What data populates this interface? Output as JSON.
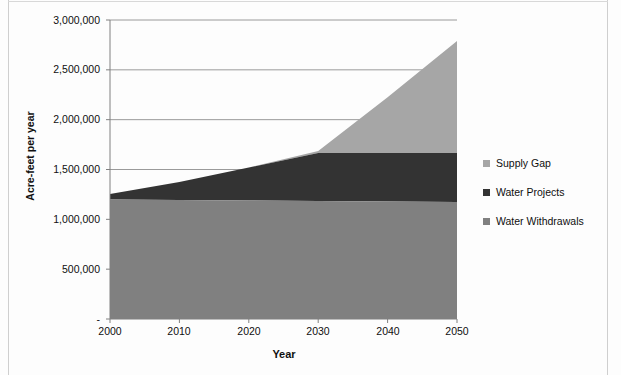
{
  "chart_data": {
    "type": "area",
    "title": "",
    "subtitle": "",
    "xlabel": "Year",
    "ylabel": "Acre-feet per year",
    "x": [
      2000,
      2010,
      2020,
      2030,
      2040,
      2050
    ],
    "xlim": [
      2000,
      2050
    ],
    "ylim": [
      0,
      3000000
    ],
    "xticks": [
      "2000",
      "2010",
      "2020",
      "2030",
      "2040",
      "2050"
    ],
    "yticks": [
      "-",
      "500,000",
      "1,000,000",
      "1,500,000",
      "2,000,000",
      "2,500,000",
      "3,000,000"
    ],
    "ytick_values": [
      0,
      500000,
      1000000,
      1500000,
      2000000,
      2500000,
      3000000
    ],
    "grid": true,
    "grid_axis": "y",
    "stacked": true,
    "legend_position": "right",
    "series": [
      {
        "name": "Water Withdrawals",
        "color": "#808080",
        "values": [
          1200000,
          1195000,
          1190000,
          1185000,
          1180000,
          1175000
        ]
      },
      {
        "name": "Water Projects",
        "color": "#333333",
        "values": [
          55000,
          180000,
          330000,
          480000,
          485000,
          490000
        ]
      },
      {
        "name": "Supply Gap",
        "color": "#a6a6a6",
        "values": [
          0,
          0,
          0,
          20000,
          560000,
          1125000
        ]
      }
    ],
    "cumulative_tops": {
      "water_withdrawals": [
        1200000,
        1195000,
        1190000,
        1185000,
        1180000,
        1175000
      ],
      "water_projects": [
        1255000,
        1375000,
        1520000,
        1665000,
        1665000,
        1665000
      ],
      "supply_gap": [
        1255000,
        1375000,
        1520000,
        1685000,
        2225000,
        2790000
      ]
    }
  },
  "legend": {
    "items": [
      {
        "label": "Supply Gap",
        "color": "#a6a6a6"
      },
      {
        "label": "Water Projects",
        "color": "#333333"
      },
      {
        "label": "Water Withdrawals",
        "color": "#808080"
      }
    ]
  },
  "axes": {
    "y_title": "Acre-feet per year",
    "x_title": "Year",
    "y_labels": [
      "3,000,000",
      "2,500,000",
      "2,000,000",
      "1,500,000",
      "1,000,000",
      "500,000",
      "-"
    ],
    "x_labels": [
      "2000",
      "2010",
      "2020",
      "2030",
      "2040",
      "2050"
    ]
  },
  "colors": {
    "supply_gap": "#a6a6a6",
    "water_projects": "#333333",
    "water_withdrawals": "#808080",
    "axis": "#808080",
    "grid": "#9a9a9a",
    "text": "#0f0f0f"
  }
}
